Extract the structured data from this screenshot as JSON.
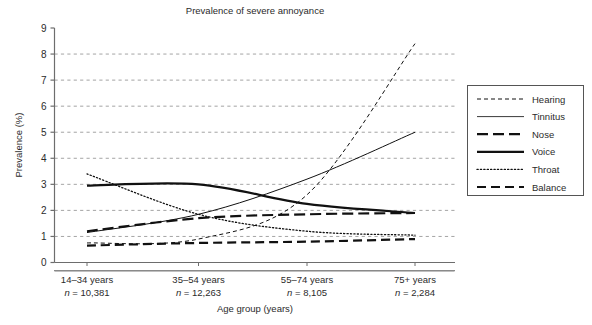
{
  "chart_data": {
    "type": "line",
    "title": "Prevalence of severe annoyance",
    "xlabel": "Age group (years)",
    "ylabel": "Prevalence (%)",
    "categories": [
      "14–34 years",
      "35–54 years",
      "55–74 years",
      "75+ years"
    ],
    "category_counts": [
      "n = 10,381",
      "n = 12,263",
      "n = 8,105",
      "n = 2,284"
    ],
    "ylim": [
      0,
      9
    ],
    "yticks": [
      0,
      1,
      2,
      3,
      4,
      5,
      6,
      7,
      8,
      9
    ],
    "ytick_labels": [
      "0",
      "1",
      "2",
      "3",
      "4",
      "5",
      "6",
      "7",
      "8",
      "9"
    ],
    "grid": true,
    "legend_position": "right",
    "series": [
      {
        "name": "Hearing",
        "values": [
          0.75,
          0.9,
          2.6,
          8.4
        ],
        "style": "fine-dash",
        "width": 1.0
      },
      {
        "name": "Tinnitus",
        "values": [
          1.15,
          1.85,
          3.2,
          5.0
        ],
        "style": "thin-solid",
        "width": 1.0
      },
      {
        "name": "Nose",
        "values": [
          1.2,
          1.7,
          1.85,
          1.9
        ],
        "style": "long-dash",
        "width": 2.2
      },
      {
        "name": "Voice",
        "values": [
          2.95,
          3.0,
          2.25,
          1.9
        ],
        "style": "solid",
        "width": 2.2
      },
      {
        "name": "Throat",
        "values": [
          3.4,
          1.85,
          1.2,
          1.05
        ],
        "style": "dotted",
        "width": 1.3
      },
      {
        "name": "Balance",
        "values": [
          0.65,
          0.75,
          0.8,
          0.9
        ],
        "style": "dash",
        "width": 2.2
      }
    ],
    "series_note_order": [
      "Hearing",
      "Tinnitus",
      "Nose",
      "Voice",
      "Throat",
      "Balance"
    ],
    "colors": {
      "line": "#111111",
      "grid": "#8d8d8d",
      "axis": "#6d6d6d",
      "text": "#2b2b2b"
    }
  },
  "legend": {
    "items": [
      {
        "label": "Hearing"
      },
      {
        "label": "Tinnitus"
      },
      {
        "label": "Nose"
      },
      {
        "label": "Voice"
      },
      {
        "label": "Throat"
      },
      {
        "label": "Balance"
      }
    ]
  }
}
